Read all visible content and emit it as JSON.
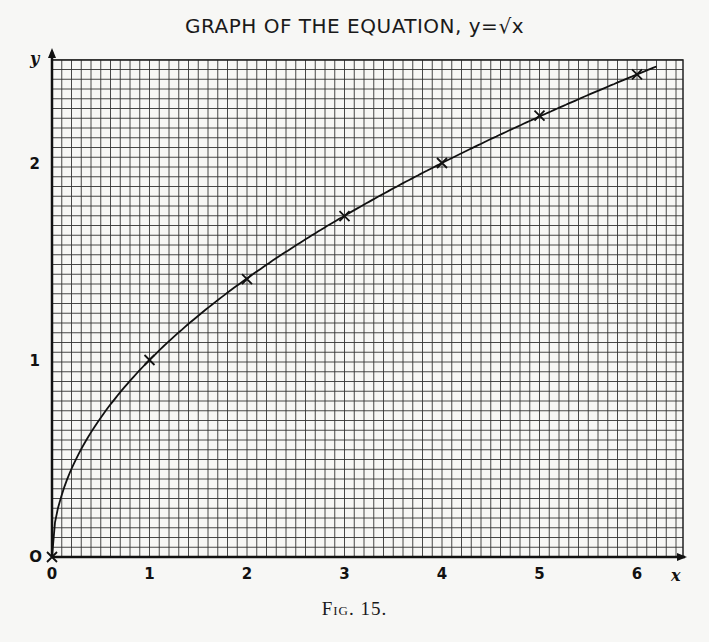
{
  "chart_data": {
    "type": "line",
    "title": "GRAPH OF THE EQUATION, y=√x",
    "xlabel": "x",
    "ylabel": "y",
    "origin_label": "O",
    "x_ticks": [
      "0",
      "1",
      "2",
      "3",
      "4",
      "5",
      "6"
    ],
    "y_ticks": [
      "0",
      "1",
      "2"
    ],
    "xlim": [
      0,
      6.3
    ],
    "ylim": [
      0,
      2.5
    ],
    "grid": true,
    "series": [
      {
        "name": "y = √x",
        "x": [
          0,
          1,
          2,
          3,
          4,
          5,
          6
        ],
        "y": [
          0,
          1,
          1.41,
          1.73,
          2,
          2.24,
          2.45
        ],
        "marker": "x"
      }
    ],
    "caption": "Fig. 15."
  },
  "title": "GRAPH OF THE EQUATION, y=√x",
  "caption": "Fig. 15."
}
